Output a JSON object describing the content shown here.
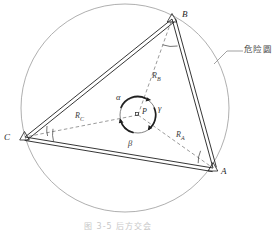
{
  "figure": {
    "title_caption": "图 3-5  后方交会",
    "annotation_label": "危险圆",
    "point_center_label": "P",
    "vertices": [
      {
        "id": "A",
        "label": "A",
        "x": 213,
        "y": 168
      },
      {
        "id": "B",
        "label": "B",
        "x": 172,
        "y": 19
      },
      {
        "id": "C",
        "label": "C",
        "x": 25,
        "y": 137
      }
    ],
    "radii": [
      {
        "id": "RA",
        "label": "R",
        "sub": "A",
        "x": 176,
        "y": 131
      },
      {
        "id": "RB",
        "label": "R",
        "sub": "B",
        "x": 152,
        "y": 72
      },
      {
        "id": "RC",
        "label": "R",
        "sub": "C",
        "x": 75,
        "y": 112
      }
    ],
    "angles": [
      {
        "id": "alpha",
        "label": "α",
        "x": 116,
        "y": 93
      },
      {
        "id": "beta",
        "label": "β",
        "x": 129,
        "y": 140
      },
      {
        "id": "gamma",
        "label": "γ",
        "x": 159,
        "y": 105
      }
    ],
    "big_circle": {
      "cx": 125,
      "cy": 108,
      "r": 104
    },
    "small_circle": {
      "cx": 138,
      "cy": 115,
      "r": 18
    },
    "colors": {
      "stroke_dark": "#1f1f1f",
      "stroke_circle": "#8a8a8a",
      "stroke_dashed": "#6f6f6f",
      "text": "#2a2a2a",
      "annotation": "#4a4a4a"
    }
  }
}
